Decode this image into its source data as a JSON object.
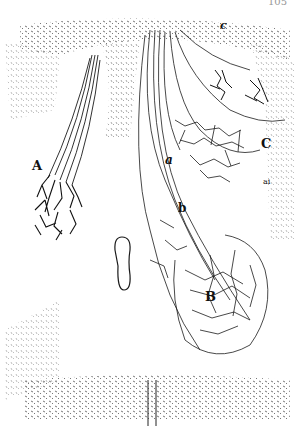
{
  "page": {
    "number": "105"
  },
  "figure": {
    "labels": [
      {
        "id": "A",
        "text": "A",
        "x": 32,
        "y": 159,
        "size": 13
      },
      {
        "id": "a",
        "text": "a",
        "x": 165,
        "y": 154,
        "size": 12
      },
      {
        "id": "b",
        "text": "b",
        "x": 178,
        "y": 202,
        "size": 12
      },
      {
        "id": "B",
        "text": "B",
        "x": 205,
        "y": 290,
        "size": 13
      },
      {
        "id": "C",
        "text": "C",
        "x": 261,
        "y": 137,
        "size": 13
      },
      {
        "id": "c",
        "text": "c",
        "x": 220,
        "y": 20,
        "size": 11
      },
      {
        "id": "ai",
        "text": "ai",
        "x": 263,
        "y": 178,
        "size": 8
      }
    ]
  },
  "colors": {
    "ink": "#1a1a1a",
    "stipple": "#555555",
    "paper": "#ffffff"
  }
}
